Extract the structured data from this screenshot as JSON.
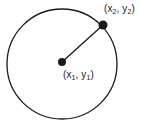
{
  "figure": {
    "type": "geometry-diagram",
    "background_color": "#ffffff",
    "stroke_color": "#1a1a1a",
    "labels": {
      "center_point": {
        "prefix": "(x",
        "sub1": "1",
        "middle": ", y",
        "sub2": "1",
        "suffix": ")",
        "full_text": "(x1, y1)"
      },
      "outer_point": {
        "prefix": "(x",
        "sub1": "2",
        "middle": ", y",
        "sub2": "2",
        "suffix": ")",
        "full_text": "(x2, y2)"
      }
    },
    "geometry": {
      "circle": {
        "cx": 62,
        "cy": 64,
        "r": 55,
        "stroke_width": 1.3
      },
      "center_dot": {
        "cx": 62,
        "cy": 62,
        "r": 4
      },
      "outer_dot": {
        "cx": 103,
        "cy": 25,
        "r": 4.5
      },
      "radius_line": {
        "x1": 62,
        "y1": 62,
        "x2": 103,
        "y2": 25,
        "stroke_width": 1.3
      }
    }
  }
}
